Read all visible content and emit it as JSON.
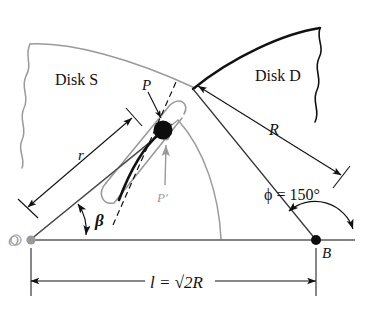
{
  "figure": {
    "type": "mechanism-diagram",
    "background_color": "#ffffff",
    "ink_color": "#111111",
    "gray_color": "#9a9a9a",
    "labels": {
      "disk_s": "Disk S",
      "disk_d": "Disk D",
      "radius_r_small": "r",
      "radius_r_big": "R",
      "point_p": "P",
      "point_p_prime": "P′",
      "point_o": "O",
      "point_b": "B",
      "angle_beta": "β",
      "angle_phi": "ϕ = 150°",
      "length_l": "l = √2R"
    },
    "values": {
      "phi_symbol": "ϕ",
      "phi_equals": "=",
      "phi_value": "150",
      "phi_unit": "°",
      "l_symbol": "l",
      "l_equals": "=",
      "l_value": "√2R"
    },
    "geometry": {
      "point_o": [
        30,
        240
      ],
      "point_b": [
        316,
        240
      ],
      "point_p": [
        163,
        130
      ],
      "baseline_y": 240,
      "dimension_line_y": 280,
      "disk_s_arc_color": "#9a9a9a",
      "disk_d_arc_color": "#111111"
    }
  }
}
